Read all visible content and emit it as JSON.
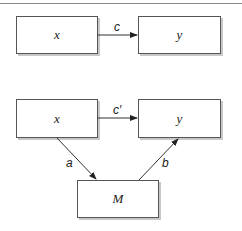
{
  "diagram": {
    "top": {
      "left_box": "x",
      "right_box": "y",
      "path_label": "c"
    },
    "bottom": {
      "left_box": "x",
      "right_box": "y",
      "mediator_box": "M",
      "direct_label": "c′",
      "path_a_label": "a",
      "path_b_label": "b"
    }
  }
}
